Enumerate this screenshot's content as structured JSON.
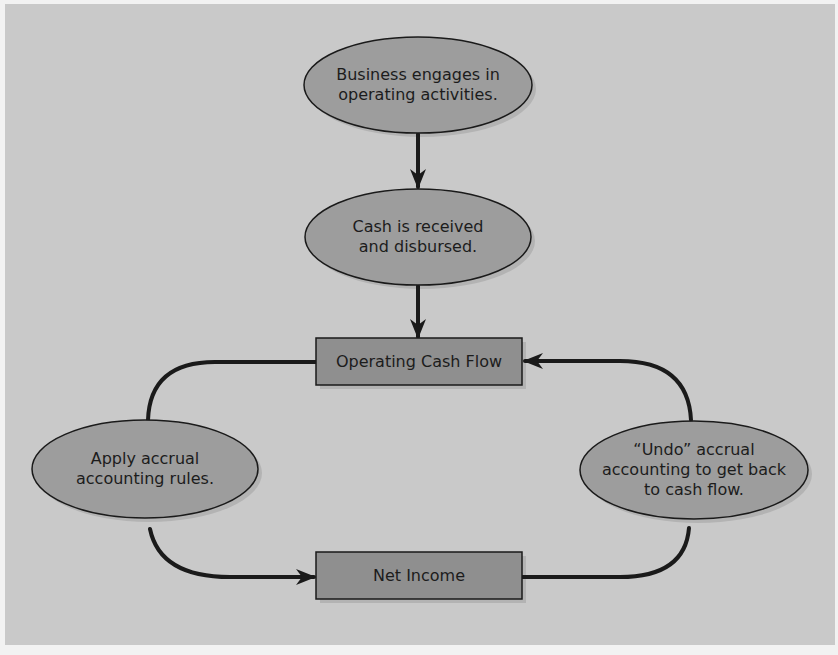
{
  "diagram": {
    "type": "flowchart",
    "colors": {
      "background": "#c9c9c9",
      "node_fill": "#9d9d9d",
      "box_fill": "#8f8f8f",
      "stroke": "#1a1a1a",
      "shadow": "#b0b0b0"
    },
    "nodes": {
      "operating_activities": {
        "shape": "ellipse",
        "label": "Business engages in\noperating activities."
      },
      "cash_received": {
        "shape": "ellipse",
        "label": "Cash is received\nand disbursed."
      },
      "operating_cash_flow": {
        "shape": "rectangle",
        "label": "Operating Cash Flow"
      },
      "apply_accrual": {
        "shape": "ellipse",
        "label": "Apply accrual\naccounting rules."
      },
      "undo_accrual": {
        "shape": "ellipse",
        "label": "“Undo” accrual\naccounting to get back\nto cash flow."
      },
      "net_income": {
        "shape": "rectangle",
        "label": "Net Income"
      }
    },
    "edges": [
      {
        "from": "operating_activities",
        "to": "cash_received",
        "arrow": "end"
      },
      {
        "from": "cash_received",
        "to": "operating_cash_flow",
        "arrow": "end"
      },
      {
        "from": "operating_cash_flow",
        "to": "apply_accrual",
        "arrow": "none"
      },
      {
        "from": "apply_accrual",
        "to": "net_income",
        "arrow": "end"
      },
      {
        "from": "net_income",
        "to": "undo_accrual",
        "arrow": "none"
      },
      {
        "from": "undo_accrual",
        "to": "operating_cash_flow",
        "arrow": "end"
      }
    ]
  }
}
